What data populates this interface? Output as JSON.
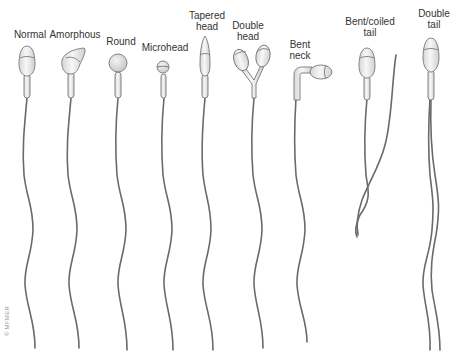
{
  "figure": {
    "copyright": "© MFMER",
    "colors": {
      "head_fill": "#ececec",
      "head_stroke": "#6e6e6e",
      "tail": "#6a6a6a",
      "text": "#333333"
    }
  },
  "types": [
    {
      "id": "normal",
      "label": "Normal"
    },
    {
      "id": "amorphous",
      "label": "Amorphous"
    },
    {
      "id": "round",
      "label": "Round"
    },
    {
      "id": "microhead",
      "label": "Microhead"
    },
    {
      "id": "tapered",
      "label_line1": "Tapered",
      "label_line2": "head"
    },
    {
      "id": "double-head",
      "label_line1": "Double",
      "label_line2": "head"
    },
    {
      "id": "bent-neck",
      "label_line1": "Bent",
      "label_line2": "neck"
    },
    {
      "id": "bent-coiled-tail",
      "label_line1": "Bent/coiled",
      "label_line2": "tail"
    },
    {
      "id": "double-tail",
      "label_line1": "Double",
      "label_line2": "tail"
    }
  ]
}
